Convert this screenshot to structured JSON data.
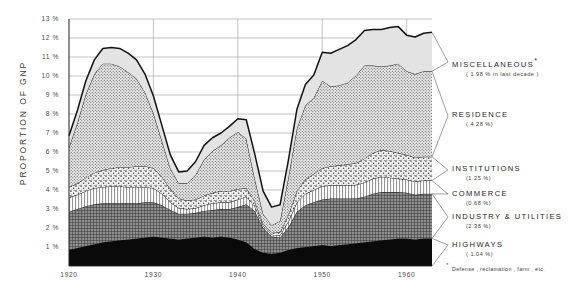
{
  "chart_data": {
    "type": "area",
    "title": "",
    "subtitle": "",
    "xlabel": "",
    "ylabel": "PROPORTION  OF  GNP",
    "stacked": true,
    "grid": true,
    "legend_position": "right",
    "xlim": [
      1920,
      1963
    ],
    "ylim": [
      0,
      13
    ],
    "x_tick_labels": [
      "1920",
      "1930",
      "1940",
      "1950",
      "1960"
    ],
    "x_ticks": [
      1920,
      1930,
      1940,
      1950,
      1960
    ],
    "y_tick_labels": [
      "13 %",
      "12 %",
      "11 %",
      "10 %",
      "9 %",
      "8 %",
      "7 %",
      "6 %",
      "5 %",
      "4 %",
      "3 %",
      "2 %",
      "1 %"
    ],
    "y_ticks": [
      13,
      12,
      11,
      10,
      9,
      8,
      7,
      6,
      5,
      4,
      3,
      2,
      1
    ],
    "x": [
      1920,
      1921,
      1922,
      1923,
      1924,
      1925,
      1926,
      1927,
      1928,
      1929,
      1930,
      1931,
      1932,
      1933,
      1934,
      1935,
      1936,
      1937,
      1938,
      1939,
      1940,
      1941,
      1942,
      1943,
      1944,
      1945,
      1946,
      1947,
      1948,
      1949,
      1950,
      1951,
      1952,
      1953,
      1954,
      1955,
      1956,
      1957,
      1958,
      1959,
      1960,
      1961,
      1962,
      1963
    ],
    "series": [
      {
        "name": "HIGHWAYS",
        "legend_label": "HIGHWAYS",
        "legend_value": "( 1.04 %)",
        "pattern": "solid-black",
        "values": [
          0.85,
          0.95,
          1.05,
          1.15,
          1.25,
          1.3,
          1.35,
          1.4,
          1.45,
          1.5,
          1.55,
          1.5,
          1.45,
          1.4,
          1.45,
          1.5,
          1.55,
          1.5,
          1.55,
          1.5,
          1.4,
          1.25,
          0.9,
          0.7,
          0.65,
          0.7,
          0.85,
          0.95,
          1.0,
          1.05,
          1.1,
          1.05,
          1.1,
          1.15,
          1.2,
          1.25,
          1.3,
          1.35,
          1.4,
          1.45,
          1.45,
          1.4,
          1.45,
          1.45
        ]
      },
      {
        "name": "INDUSTRY & UTILITIES",
        "legend_label": "INDUSTRY & UTILITIES",
        "legend_value": "(2.38 %)",
        "pattern": "dark-crosshatch",
        "values": [
          2.0,
          2.05,
          2.1,
          2.1,
          2.05,
          2.0,
          1.95,
          1.9,
          1.85,
          1.85,
          1.8,
          1.7,
          1.5,
          1.35,
          1.3,
          1.3,
          1.35,
          1.45,
          1.45,
          1.5,
          1.7,
          2.0,
          2.0,
          1.3,
          0.9,
          0.8,
          1.2,
          1.9,
          2.2,
          2.3,
          2.4,
          2.5,
          2.45,
          2.4,
          2.35,
          2.4,
          2.5,
          2.55,
          2.5,
          2.45,
          2.4,
          2.35,
          2.35,
          2.35
        ]
      },
      {
        "name": "COMMERCE",
        "legend_label": "COMMERCE",
        "legend_value": "(0.68 %)",
        "pattern": "vertical-lines",
        "values": [
          0.75,
          0.75,
          0.8,
          0.85,
          0.85,
          0.9,
          0.9,
          0.85,
          0.85,
          0.8,
          0.75,
          0.6,
          0.4,
          0.3,
          0.25,
          0.25,
          0.3,
          0.35,
          0.35,
          0.35,
          0.4,
          0.4,
          0.25,
          0.12,
          0.1,
          0.12,
          0.3,
          0.5,
          0.6,
          0.65,
          0.7,
          0.7,
          0.7,
          0.7,
          0.72,
          0.75,
          0.8,
          0.8,
          0.75,
          0.7,
          0.7,
          0.7,
          0.7,
          0.7
        ]
      },
      {
        "name": "INSTITUTIONS",
        "legend_label": "INSTITUTIONS",
        "legend_value": "(1.25 %)",
        "pattern": "coarse-stipple",
        "values": [
          0.55,
          0.6,
          0.7,
          0.8,
          0.9,
          0.95,
          1.0,
          1.05,
          1.1,
          1.1,
          1.05,
          0.9,
          0.7,
          0.5,
          0.45,
          0.45,
          0.5,
          0.55,
          0.6,
          0.6,
          0.55,
          0.45,
          0.25,
          0.12,
          0.1,
          0.15,
          0.35,
          0.6,
          0.75,
          0.85,
          0.95,
          1.0,
          1.05,
          1.1,
          1.15,
          1.25,
          1.35,
          1.4,
          1.4,
          1.35,
          1.3,
          1.25,
          1.25,
          1.25
        ]
      },
      {
        "name": "RESIDENCE",
        "legend_label": "RESIDENCE",
        "legend_value": "( 4.28 %)",
        "pattern": "fine-dot",
        "values": [
          2.1,
          3.2,
          4.4,
          5.2,
          5.6,
          5.5,
          5.3,
          5.0,
          4.6,
          3.9,
          2.9,
          1.9,
          1.1,
          0.8,
          0.9,
          1.3,
          1.9,
          2.2,
          2.4,
          2.8,
          3.0,
          2.6,
          1.2,
          0.5,
          0.4,
          0.6,
          2.0,
          3.3,
          3.9,
          4.0,
          4.6,
          4.2,
          4.2,
          4.3,
          4.6,
          4.9,
          4.6,
          4.4,
          4.5,
          4.7,
          4.4,
          4.4,
          4.5,
          4.5
        ]
      },
      {
        "name": "MISCELLANEOUS",
        "legend_label": "MISCELLANEOUS",
        "legend_value": "( 1.98 % in last decade )",
        "legend_has_star": true,
        "pattern": "light-grey",
        "values": [
          0.6,
          0.65,
          0.7,
          0.75,
          0.8,
          0.85,
          0.95,
          1.0,
          1.0,
          0.95,
          0.9,
          0.8,
          0.7,
          0.6,
          0.65,
          0.7,
          0.75,
          0.7,
          0.65,
          0.6,
          0.7,
          1.0,
          1.3,
          1.2,
          0.95,
          0.85,
          0.9,
          1.0,
          1.1,
          1.2,
          1.5,
          1.75,
          1.9,
          1.95,
          1.9,
          1.85,
          1.9,
          1.95,
          2.0,
          1.95,
          1.9,
          1.95,
          2.0,
          2.05
        ]
      }
    ],
    "footnote": "Defense , reclamation , farm , etc.",
    "footnote_marker": "*"
  }
}
